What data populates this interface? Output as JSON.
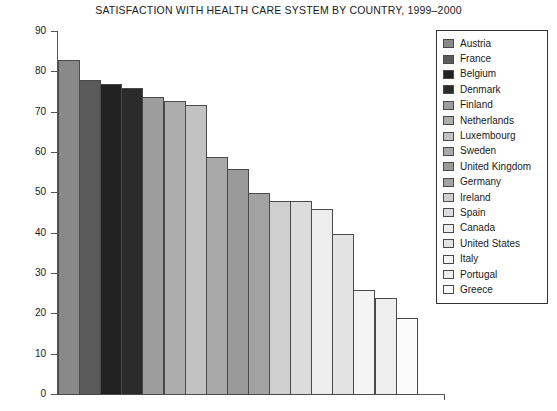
{
  "chart_data": {
    "type": "bar",
    "title": "SATISFACTION WITH HEALTH CARE SYSTEM BY COUNTRY, 1999–2000",
    "xlabel": "",
    "ylabel": "Percentage Satisfaction",
    "ylim": [
      0,
      90
    ],
    "ytick_labels": [
      "90",
      "80",
      "70",
      "60",
      "50",
      "40",
      "30",
      "20",
      "10",
      "0"
    ],
    "yticks": [
      90,
      80,
      70,
      60,
      50,
      40,
      30,
      20,
      10,
      0
    ],
    "grid": false,
    "legend_position": "right",
    "categories": [
      "Austria",
      "France",
      "Belgium",
      "Denmark",
      "Finland",
      "Netherlands",
      "Luxembourg",
      "Sweden",
      "United Kingdom",
      "Germany",
      "Ireland",
      "Spain",
      "Canada",
      "United States",
      "Italy",
      "Portugal",
      "Greece"
    ],
    "values": [
      83,
      78,
      77,
      76,
      74,
      73,
      72,
      59,
      56,
      50,
      48,
      48,
      46,
      40,
      26,
      24,
      19
    ],
    "colors": [
      "#898989",
      "#5a5a5a",
      "#222222",
      "#2b2b2b",
      "#9d9d9d",
      "#adadad",
      "#c2c2c2",
      "#a8a8a8",
      "#9a9a9a",
      "#a2a2a2",
      "#cfcfcf",
      "#dcdcdc",
      "#ededed",
      "#e3e3e3",
      "#f4f4f4",
      "#efefef",
      "#fbfbfb"
    ]
  },
  "legend": {
    "items": [
      {
        "label": "Austria",
        "color": "#898989"
      },
      {
        "label": "France",
        "color": "#5a5a5a"
      },
      {
        "label": "Belgium",
        "color": "#222222"
      },
      {
        "label": "Denmark",
        "color": "#2b2b2b"
      },
      {
        "label": "Finland",
        "color": "#9d9d9d"
      },
      {
        "label": "Netherlands",
        "color": "#adadad"
      },
      {
        "label": "Luxembourg",
        "color": "#c2c2c2"
      },
      {
        "label": "Sweden",
        "color": "#a8a8a8"
      },
      {
        "label": "United Kingdom",
        "color": "#9a9a9a"
      },
      {
        "label": "Germany",
        "color": "#a2a2a2"
      },
      {
        "label": "Ireland",
        "color": "#cfcfcf"
      },
      {
        "label": "Spain",
        "color": "#dcdcdc"
      },
      {
        "label": "Canada",
        "color": "#ededed"
      },
      {
        "label": "United States",
        "color": "#e3e3e3"
      },
      {
        "label": "Italy",
        "color": "#f4f4f4"
      },
      {
        "label": "Portugal",
        "color": "#efefef"
      },
      {
        "label": "Greece",
        "color": "#fbfbfb"
      }
    ]
  }
}
